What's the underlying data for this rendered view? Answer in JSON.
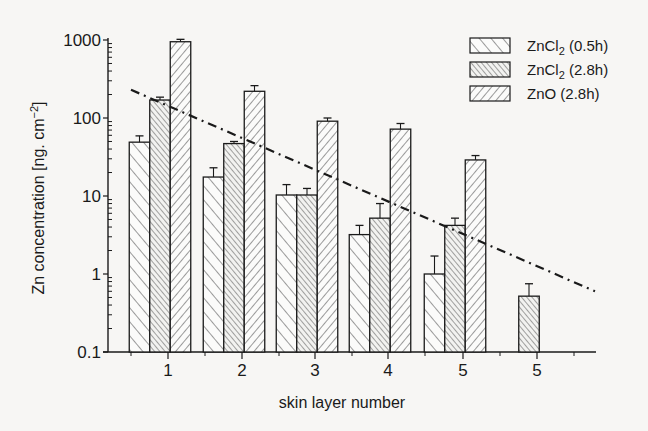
{
  "chart_data": {
    "type": "bar",
    "title": "",
    "xlabel": "skin layer number",
    "ylabel": "Zn concentration [ng. cm⁻²]",
    "yscale": "log",
    "ylim": [
      0.1,
      1000
    ],
    "yticks": [
      "0.1",
      "1",
      "10",
      "100",
      "1000"
    ],
    "categories": [
      "1",
      "2",
      "3",
      "4",
      "5",
      "5"
    ],
    "series": [
      {
        "name": "ZnCl₂ (0.5h)",
        "legend_main": "ZnCl",
        "legend_sub": "2",
        "legend_tail": " (0.5h)",
        "pattern": "wide-diagonal-up",
        "values": [
          49,
          17.5,
          10.3,
          3.2,
          1.0,
          null
        ],
        "error_upper": [
          59,
          23,
          14,
          4.2,
          1.7,
          null
        ]
      },
      {
        "name": "ZnCl₂ (2.8h)",
        "legend_main": "ZnCl",
        "legend_sub": "2",
        "legend_tail": " (2.8h)",
        "pattern": "dense-diagonal-up",
        "values": [
          170,
          47,
          10.3,
          5.2,
          4.2,
          0.52
        ],
        "error_upper": [
          185,
          50,
          12.5,
          8.0,
          5.2,
          0.75
        ]
      },
      {
        "name": "ZnO (2.8h)",
        "legend_main": "ZnO",
        "legend_sub": "",
        "legend_tail": "  (2.8h)",
        "pattern": "diagonal-down",
        "values": [
          950,
          220,
          91,
          72,
          29,
          null
        ],
        "error_upper": [
          1020,
          260,
          100,
          85,
          33,
          null
        ]
      }
    ],
    "trendline": {
      "style": "dash-dot",
      "from": {
        "x_group": 0.35,
        "y": 230
      },
      "to": {
        "x_group": 6.2,
        "y": 0.6
      }
    },
    "grid": false,
    "legend_position": "top-right"
  }
}
